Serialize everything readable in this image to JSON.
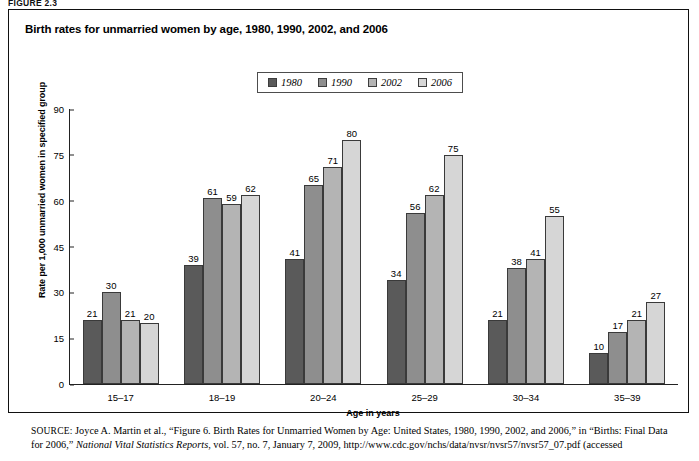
{
  "figure_tag": "FIGURE 2.3",
  "panel": {
    "title": "Birth rates for unmarried women by age, 1980, 1990, 2002, and 2006"
  },
  "legend": {
    "items": [
      {
        "label": "1980",
        "color": "#5a5a5a"
      },
      {
        "label": "1990",
        "color": "#8e8e8e"
      },
      {
        "label": "2002",
        "color": "#b4b4b4"
      },
      {
        "label": "2006",
        "color": "#d6d6d6"
      }
    ]
  },
  "chart_data": {
    "type": "bar",
    "title": "Birth rates for unmarried women by age, 1980, 1990, 2002, and 2006",
    "xlabel": "Age in years",
    "ylabel": "Rate per 1,000 unmarried women in specified group",
    "ylim": [
      0,
      90
    ],
    "yticks": [
      "0",
      "15",
      "30",
      "45",
      "60",
      "75",
      "90"
    ],
    "grid": false,
    "legend_position": "top-center",
    "categories": [
      "15–17",
      "18–19",
      "20–24",
      "25–29",
      "30–34",
      "35–39"
    ],
    "series": [
      {
        "name": "1980",
        "color": "#5a5a5a",
        "values": [
          21,
          39,
          41,
          34,
          21,
          10
        ]
      },
      {
        "name": "1990",
        "color": "#8e8e8e",
        "values": [
          30,
          61,
          65,
          56,
          38,
          17
        ]
      },
      {
        "name": "2002",
        "color": "#b4b4b4",
        "values": [
          21,
          59,
          71,
          62,
          41,
          21
        ]
      },
      {
        "name": "2006",
        "color": "#d6d6d6",
        "values": [
          20,
          62,
          80,
          75,
          55,
          27
        ]
      }
    ]
  },
  "source": {
    "label": "SOURCE:",
    "line1": " Joyce A. Martin et al., “Figure 6. Birth Rates for Unmarried Women by Age: United States, 1980, 1990, 2002, and 2006,” in “Births: Final Data for 2006,” ",
    "italic": "National Vital Statistics Reports",
    "line2": ", vol. 57, no. 7, January 7, 2009, http://www.cdc.gov/nchs/data/nvsr/nvsr57/nvsr57_07.pdf (accessed"
  }
}
